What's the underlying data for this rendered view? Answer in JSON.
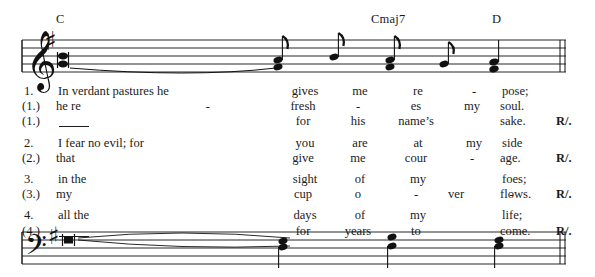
{
  "document": {
    "type": "musical-score",
    "description": "Responsorial psalm setting with treble and bass staves, chord symbols and four lyric verses"
  },
  "chord_symbols": [
    {
      "label": "C",
      "x": 56,
      "y": 12
    },
    {
      "label": "Cmaj7",
      "x": 371,
      "y": 12
    },
    {
      "label": "D",
      "x": 492,
      "y": 12
    }
  ],
  "staves": {
    "treble": {
      "clef": "treble-clef",
      "key_signature": "one-sharp",
      "barline": "final-double-barline"
    },
    "bass": {
      "clef": "bass-clef",
      "key_signature": "one-sharp",
      "barline": "final-double-barline"
    }
  },
  "lyrics": {
    "groups": [
      {
        "rows": [
          {
            "num": "1.",
            "a": "In verdant pastures he",
            "b": "gives",
            "c": "me",
            "d": "re",
            "e": "-",
            "f": "pose;",
            "r": ""
          },
          {
            "num": "(1.)",
            "a": "he re",
            "b": "fresh",
            "c": "-",
            "d": "es",
            "e": "my",
            "f": "soul.",
            "r": "",
            "a_dash": true
          },
          {
            "num": "(1.)",
            "a": "",
            "b": "for",
            "c": "his",
            "d": "name’s",
            "e": "",
            "f": "sake.",
            "r": "R/.",
            "a_blank": true
          }
        ]
      },
      {
        "rows": [
          {
            "num": "2.",
            "a": "I fear no evil; for",
            "b": "you",
            "c": "are",
            "d": "at",
            "e": "my",
            "f": "side",
            "r": ""
          },
          {
            "num": "(2.)",
            "a": "that",
            "b": "give",
            "c": "me",
            "d": "cour",
            "e": "-",
            "f": "age.",
            "r": "R/."
          }
        ]
      },
      {
        "rows": [
          {
            "num": "3.",
            "a": "in the",
            "b": "sight",
            "c": "of",
            "d": "my",
            "e": "",
            "f": "foes;",
            "r": ""
          },
          {
            "num": "(3.)",
            "a": "my",
            "b": "cup",
            "c": "o",
            "d": "-",
            "e": "ver",
            "f": "flows.",
            "r": "R/.",
            "e_dash": true
          }
        ]
      },
      {
        "rows": [
          {
            "num": "4.",
            "a": "all the",
            "b": "days",
            "c": "of",
            "d": "my",
            "e": "",
            "f": "life;",
            "r": ""
          },
          {
            "num": "(4.)",
            "a": "",
            "b": "for",
            "c": "years",
            "d": "to",
            "e": "",
            "f": "come.",
            "r": "R/.",
            "a_blank": true
          }
        ]
      }
    ]
  }
}
